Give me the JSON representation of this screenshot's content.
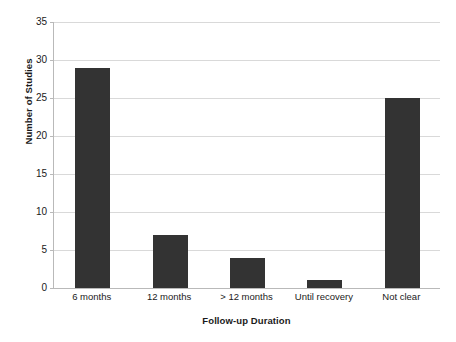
{
  "chart_data": {
    "type": "bar",
    "title": "",
    "xlabel": "Follow-up Duration",
    "ylabel": "Number of Studies",
    "categories": [
      "6 months",
      "12 months",
      "> 12 months",
      "Until recovery",
      "Not clear"
    ],
    "values": [
      29,
      7,
      4,
      1,
      25
    ],
    "series": [
      {
        "name": "Number of Studies",
        "values": [
          29,
          7,
          4,
          1,
          25
        ]
      }
    ],
    "ylim": [
      0,
      35
    ],
    "ytick_labels": [
      "0",
      "5",
      "10",
      "15",
      "20",
      "25",
      "30",
      "35"
    ],
    "ytick_values": [
      0,
      5,
      10,
      15,
      20,
      25,
      30,
      35
    ],
    "grid": "horizontal",
    "legend": "none",
    "bar_color": "#333333",
    "gridline_color": "#d9d9d9",
    "axis_color": "#b9b9b9",
    "background_color": "#ffffff"
  }
}
